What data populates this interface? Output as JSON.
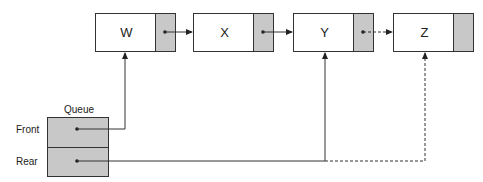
{
  "diagram": {
    "nodes": [
      {
        "id": "W",
        "label": "W"
      },
      {
        "id": "X",
        "label": "X"
      },
      {
        "id": "Y",
        "label": "Y"
      },
      {
        "id": "Z",
        "label": "Z"
      }
    ],
    "queue": {
      "title": "Queue",
      "fields": [
        {
          "name": "front",
          "label": "Front"
        },
        {
          "name": "rear",
          "label": "Rear"
        }
      ]
    },
    "edges": [
      {
        "from": "W.next",
        "to": "X",
        "style": "solid"
      },
      {
        "from": "X.next",
        "to": "Y",
        "style": "solid"
      },
      {
        "from": "Y.next",
        "to": "Z",
        "style": "dashed"
      },
      {
        "from": "Queue.front",
        "to": "W",
        "style": "solid"
      },
      {
        "from": "Queue.rear",
        "to": "Y",
        "style": "solid"
      },
      {
        "from": "Queue.rear",
        "to": "Z",
        "style": "dashed"
      }
    ],
    "colors": {
      "pointer_fill": "#c8c8c8",
      "line": "#333333",
      "background": "#ffffff"
    }
  }
}
